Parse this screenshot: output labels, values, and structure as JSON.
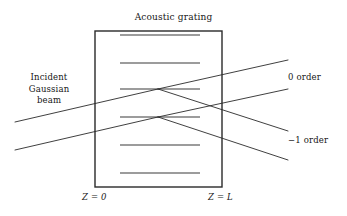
{
  "figure": {
    "title": "Acoustic grating",
    "width": 347,
    "height": 216,
    "background_color": "#ffffff",
    "line_color": "#2a2a2a"
  },
  "labels": {
    "title": "Acoustic grating",
    "incident_beam": "Incident\nGaussian\nbeam",
    "incident_beam_line1": "Incident",
    "incident_beam_line2": "Gaussian",
    "incident_beam_line3": "beam",
    "order_zero": "0 order",
    "order_minus_one": "−1 order",
    "z_start": "Z = 0",
    "z_end": "Z = L"
  },
  "grating_region": {
    "x": 95,
    "y": 31,
    "width": 127,
    "height": 156,
    "stroke_width": 1.4,
    "grating_line_count": 6,
    "grating_line_x_start": 120,
    "grating_line_x_end": 200,
    "grating_line_y_positions": [
      35,
      63,
      89,
      117,
      145,
      173
    ],
    "grating_line_stroke_width": 1.1
  },
  "rays": {
    "stroke_width": 0.9,
    "incident": [
      {
        "name": "incident-upper-ray",
        "x1": 15,
        "y1": 122,
        "x2": 158,
        "y2": 89
      },
      {
        "name": "incident-lower-ray",
        "x1": 15,
        "y1": 150,
        "x2": 158,
        "y2": 117
      }
    ],
    "order_zero": [
      {
        "name": "order0-upper-ray",
        "x1": 158,
        "y1": 89,
        "x2": 288,
        "y2": 60
      },
      {
        "name": "order0-lower-ray",
        "x1": 158,
        "y1": 117,
        "x2": 288,
        "y2": 89
      }
    ],
    "order_minus_one": [
      {
        "name": "orderm1-upper-ray",
        "x1": 158,
        "y1": 89,
        "x2": 288,
        "y2": 131
      },
      {
        "name": "orderm1-lower-ray",
        "x1": 158,
        "y1": 117,
        "x2": 288,
        "y2": 160
      }
    ],
    "interaction_points": [
      {
        "x": 158,
        "y": 89
      },
      {
        "x": 158,
        "y": 117
      }
    ]
  }
}
